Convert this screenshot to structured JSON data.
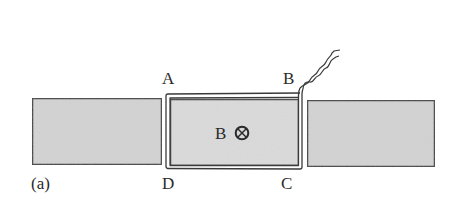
{
  "figure": {
    "panel_label": "(a)",
    "corner_labels": {
      "A": "A",
      "B": "B",
      "C": "C",
      "D": "D"
    },
    "field_label": "B",
    "field_symbol": "⊗",
    "field_direction": "into-page"
  },
  "colors": {
    "slab_fill": "#d4d4d4",
    "slab_stroke": "#3a3a3a",
    "loop_stroke": "#3a3a3a",
    "inner_fill": "#dcdcdc",
    "text": "#2a2a2a",
    "background": "#ffffff"
  }
}
